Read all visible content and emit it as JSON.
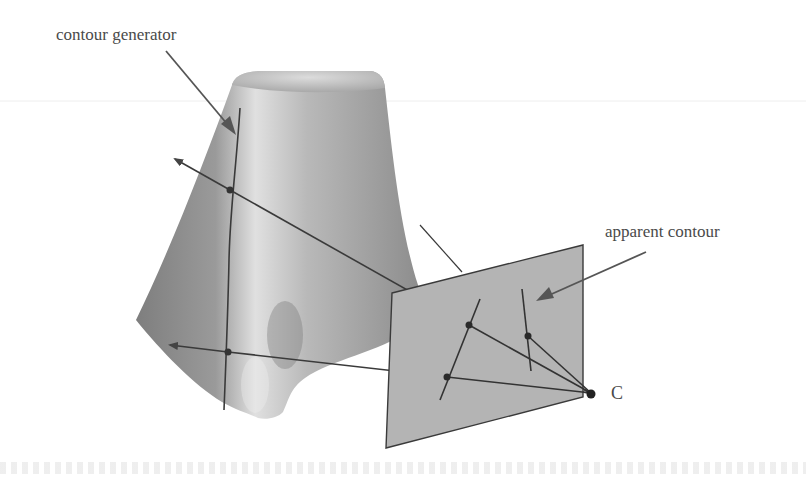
{
  "figure": {
    "labels": {
      "contour_generator": "contour generator",
      "apparent_contour": "apparent contour",
      "camera_center": "C"
    },
    "colors": {
      "surface_dark": "#8a8a8a",
      "surface_light": "#d6d6d6",
      "image_plane": "#b4b4b4",
      "lines": "#3a3a3a",
      "text": "#4a4a4a"
    }
  }
}
